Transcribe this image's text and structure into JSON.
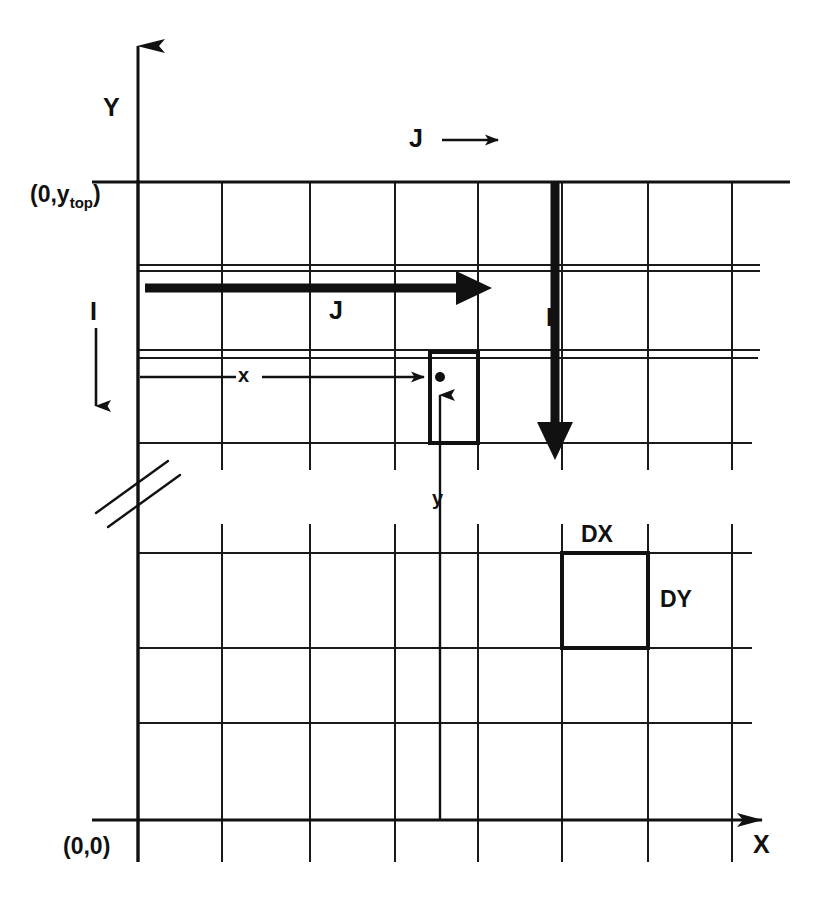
{
  "diagram": {
    "background_color": "#ffffff",
    "ink_color": "#111111",
    "axes": {
      "y_axis_label": "Y",
      "x_axis_label": "X",
      "origin_label": "(0,0)",
      "top_left_label_prefix": "(0,y",
      "top_left_label_sub": "top",
      "top_left_label_suffix": ")"
    },
    "legend": {
      "j_legend_label": "J",
      "j_legend_arrow": "right-arrow"
    },
    "annotations": {
      "j_inner_label": "J",
      "i_left_label": "I",
      "i_inner_label": "I",
      "x_offset_label": "x",
      "y_offset_label": "y",
      "dx_label": "DX",
      "dy_label": "DY"
    },
    "grid": {
      "vertical_lines_x": [
        138,
        222,
        310,
        395,
        408,
        478,
        562,
        648
      ],
      "horizontal_lines_y": [
        182,
        265,
        350,
        443,
        553,
        648,
        723,
        820
      ],
      "thin_line_width": 1.6,
      "thick_line_width": 3.2,
      "break_mark": "double-slash-break"
    },
    "cells": {
      "selected_cell": {
        "x": 430,
        "y": 352,
        "w": 48,
        "h": 91
      },
      "dxdy_cell": {
        "x": 562,
        "y": 553,
        "w": 86,
        "h": 95
      }
    },
    "arrows": {
      "j_thick_arrow": {
        "from_x": 145,
        "to_x": 490,
        "y": 288,
        "direction": "right"
      },
      "i_thick_arrow": {
        "x": 555,
        "from_y": 182,
        "to_y": 452,
        "direction": "down"
      },
      "i_left_arrow": {
        "x": 96,
        "from_y": 330,
        "to_y": 420,
        "direction": "down"
      },
      "x_measure_arrow": {
        "from_x": 140,
        "to_x": 440,
        "y": 377,
        "direction": "right"
      },
      "y_measure_arrow": {
        "x": 440,
        "from_y": 820,
        "to_y": 380,
        "direction": "up"
      }
    },
    "point_marker": {
      "x": 440,
      "y": 377,
      "shape": "filled-dot"
    }
  }
}
